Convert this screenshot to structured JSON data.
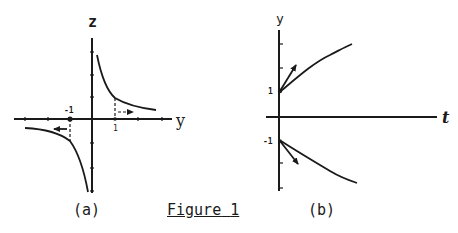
{
  "figure": {
    "title": "Figure 1",
    "title_word": "Figure",
    "title_number": "1"
  },
  "panel_a": {
    "caption": "(a)",
    "vertical_axis_label": "z",
    "horizontal_axis_label": "y",
    "tick_label_neg": "-1",
    "tick_label_pos": "1",
    "description": "Hyperbola-like curve z vs y with branches in quadrants I and III; dashed lines at y=±1 with arrows pointing away from origin"
  },
  "panel_b": {
    "caption": "(b)",
    "vertical_axis_label": "y",
    "horizontal_axis_label": "t",
    "tick_label_pos": "1",
    "tick_label_neg": "-1",
    "description": "Solution curves starting at y=1 (increasing) and y=-1 (decreasing) with tangent arrows at t=0"
  },
  "colors": {
    "ink": "#1a1a1a",
    "background": "#ffffff"
  }
}
